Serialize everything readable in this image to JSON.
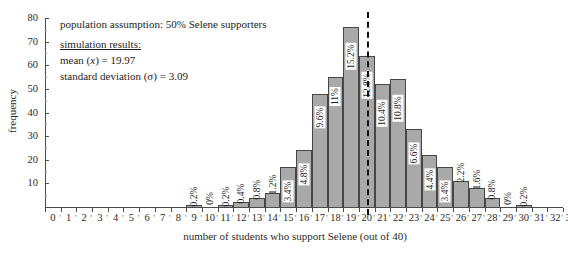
{
  "chart_data": {
    "type": "bar",
    "title": "",
    "subtitle": "",
    "xlabel": "number of students who support Selene (out of 40)",
    "ylabel": "frequency",
    "xlim": [
      0,
      33
    ],
    "ylim": [
      0,
      80
    ],
    "grid": false,
    "legend_position": "none",
    "y_ticks": [
      0,
      10,
      20,
      30,
      40,
      50,
      60,
      70,
      80
    ],
    "x_ticks": [
      0,
      1,
      2,
      3,
      4,
      5,
      6,
      7,
      8,
      9,
      10,
      11,
      12,
      13,
      14,
      15,
      16,
      17,
      18,
      19,
      20,
      21,
      22,
      23,
      24,
      25,
      26,
      27,
      28,
      29,
      30,
      31,
      32,
      33
    ],
    "categories": [
      9,
      10,
      11,
      12,
      13,
      14,
      15,
      16,
      17,
      18,
      19,
      20,
      21,
      22,
      23,
      24,
      25,
      26,
      27,
      28,
      29,
      30
    ],
    "values": [
      1,
      0,
      1,
      2,
      4,
      6,
      17,
      24,
      48,
      55,
      76,
      64,
      52,
      54,
      33,
      22,
      17,
      11,
      8,
      4,
      0,
      1
    ],
    "data_labels": [
      "0.2%",
      "0%",
      "0.2%",
      "0.4%",
      "0.8%",
      "1.2%",
      "3.4%",
      "4.8%",
      "9.6%",
      "11%",
      "15.2%",
      "12.8%",
      "10.4%",
      "10.8%",
      "6.6%",
      "4.4%",
      "3.4%",
      "2.2%",
      "1.6%",
      "0.8%",
      "0%",
      "0.2%"
    ],
    "bar_color": "#a9a9a9",
    "bar_edge_color": "#464646",
    "annotation_line": {
      "x": 20,
      "style": "dashed",
      "color": "#111111"
    },
    "annotations": [
      "population assumption: 50% Selene supporters",
      "simulation results:",
      "mean (x) = 19.97",
      "standard deviation (σ) = 3.09"
    ]
  },
  "annotations": {
    "population_assumption": "population assumption: 50% Selene supporters",
    "results_heading": "simulation results:",
    "mean_prefix": "mean (",
    "mean_var": "x",
    "mean_suffix": ") = 19.97",
    "sd_label": "standard deviation (σ) = 3.09"
  },
  "axes": {
    "y_title": "frequency",
    "x_title": "number of students who support Selene (out of 40)"
  }
}
